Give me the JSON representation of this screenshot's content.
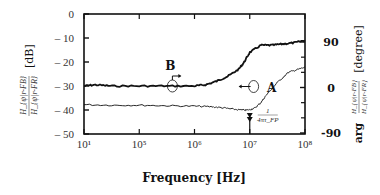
{
  "chart_data": {
    "type": "line",
    "title": "",
    "xlabel": "Frequency [Hz]",
    "ylabel_left": "|H_{ψ|r-FB} / H_{ψ|r-FR}| [dB]",
    "ylabel_left_unit": "[dB]",
    "ylabel_right": "arg(H_{ψ|r-FB} / H_{ψ|r-FR}) [degree]",
    "ylabel_right_unit": "[degree]",
    "xscale": "log",
    "x_tick_labels": [
      "10¹",
      "10⁵",
      "10⁶",
      "10⁷",
      "10⁸"
    ],
    "x_tick_exponents": [
      4,
      5,
      6,
      7,
      8
    ],
    "xlim_exponent": [
      4,
      8
    ],
    "ylim_left": [
      -50,
      0
    ],
    "y_left_ticks": [
      0,
      -10,
      -20,
      -30,
      -40,
      -50
    ],
    "y_left_tick_labels": [
      "0",
      "– 10",
      "– 20",
      "– 30",
      "– 40",
      "– 50"
    ],
    "ylim_right": [
      -90,
      90
    ],
    "y_right_ticks": [
      90,
      0,
      -90
    ],
    "y_right_tick_labels": [
      "90",
      "0",
      "-90"
    ],
    "grid": false,
    "series": [
      {
        "name": "B (magnitude)",
        "axis": "left",
        "style": "thick",
        "x_exponent": [
          4.0,
          4.2,
          4.5,
          5.0,
          5.5,
          6.0,
          6.2,
          6.4,
          6.6,
          6.8,
          6.9,
          7.0,
          7.2,
          7.4,
          7.6,
          7.8,
          8.0
        ],
        "y": [
          -30,
          -29.5,
          -30,
          -30,
          -30,
          -30,
          -29.5,
          -28,
          -26,
          -23,
          -20,
          -16,
          -13,
          -13,
          -12.5,
          -12,
          -11
        ]
      },
      {
        "name": "A (phase)",
        "axis": "right",
        "style": "thin",
        "x_exponent": [
          4.0,
          4.5,
          5.0,
          5.5,
          6.0,
          6.3,
          6.5,
          6.7,
          6.9,
          7.0,
          7.1,
          7.2,
          7.3,
          7.5,
          7.7,
          7.85,
          8.0
        ],
        "y": [
          -34,
          -35,
          -35,
          -36,
          -37,
          -38,
          -40,
          -43,
          -45,
          -44,
          -40,
          -30,
          -15,
          10,
          30,
          35,
          40
        ]
      }
    ],
    "annotations": [
      {
        "label": "B",
        "points_to": "left axis",
        "x_exponent": 5.6,
        "y_db": -30
      },
      {
        "label": "A",
        "points_to": "right axis",
        "x_exponent": 7.1,
        "y_deg": 0
      },
      {
        "label": "1/(4πτ_FP)",
        "marker": "double-arrow",
        "x_exponent": 7.0
      }
    ]
  },
  "labels": {
    "xlabel": "Frequency [Hz]",
    "left_unit": "[dB]",
    "left_fraction_num": "H_{ψ|r-FB}",
    "left_fraction_den": "H_{ψ|r-FR}",
    "right_unit": "[degree]",
    "right_prefix": "arg",
    "annot_B": "B",
    "annot_A": "A",
    "annot_freq_num": "1",
    "annot_freq_den": "4πτ_FP"
  }
}
